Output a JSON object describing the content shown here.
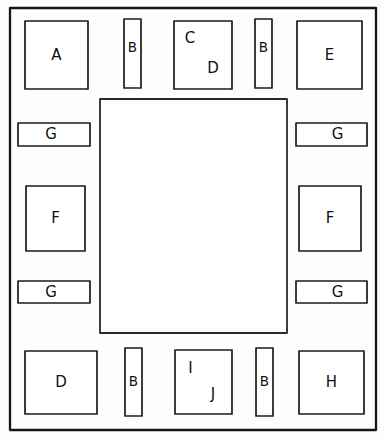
{
  "figure": {
    "style": "hand-drawn line diagram",
    "stroke_color": "#1b1b1b",
    "fill_color": "#ffffff",
    "page_color": "#f2f2f0"
  },
  "outer_frame": {
    "name": "outer-boundary",
    "x": 10,
    "y": 8,
    "width": 366,
    "height": 422
  },
  "center_region": {
    "name": "central-area",
    "label": "",
    "x": 100,
    "y": 99,
    "width": 187,
    "height": 234
  },
  "components": [
    {
      "id": "top-left-square",
      "label": "A",
      "x": 25,
      "y": 21,
      "width": 63,
      "height": 68,
      "label_dx": 0,
      "label_dy": 0
    },
    {
      "id": "top-strip-left",
      "label": "B",
      "x": 124,
      "y": 19,
      "width": 17,
      "height": 69,
      "label_dx": 0,
      "label_dy": -6
    },
    {
      "id": "top-center-square",
      "label": "C",
      "x": 174,
      "y": 21,
      "width": 58,
      "height": 68,
      "label_dx": -13,
      "label_dy": -17
    },
    {
      "id": "top-strip-right",
      "label": "B",
      "x": 255,
      "y": 19,
      "width": 17,
      "height": 69,
      "label_dx": 0,
      "label_dy": -6
    },
    {
      "id": "top-right-square",
      "label": "E",
      "x": 297,
      "y": 21,
      "width": 65,
      "height": 68,
      "label_dx": 0,
      "label_dy": 0
    },
    {
      "id": "left-strip-upper",
      "label": "G",
      "x": 18,
      "y": 123,
      "width": 72,
      "height": 23,
      "label_dx": -3,
      "label_dy": 0
    },
    {
      "id": "right-strip-upper",
      "label": "G",
      "x": 296,
      "y": 123,
      "width": 71,
      "height": 23,
      "label_dx": 6,
      "label_dy": 0
    },
    {
      "id": "left-square-middle",
      "label": "F",
      "x": 26,
      "y": 186,
      "width": 59,
      "height": 65,
      "label_dx": 0,
      "label_dy": 0
    },
    {
      "id": "right-square-middle",
      "label": "F",
      "x": 299,
      "y": 186,
      "width": 62,
      "height": 65,
      "label_dx": 0,
      "label_dy": 0
    },
    {
      "id": "left-strip-lower",
      "label": "G",
      "x": 18,
      "y": 281,
      "width": 72,
      "height": 22,
      "label_dx": -3,
      "label_dy": 0
    },
    {
      "id": "right-strip-lower",
      "label": "G",
      "x": 296,
      "y": 281,
      "width": 71,
      "height": 22,
      "label_dx": 6,
      "label_dy": 0
    },
    {
      "id": "bottom-left-square",
      "label": "D",
      "x": 25,
      "y": 351,
      "width": 72,
      "height": 63,
      "label_dx": 0,
      "label_dy": 0
    },
    {
      "id": "bottom-strip-left",
      "label": "B",
      "x": 125,
      "y": 348,
      "width": 17,
      "height": 68,
      "label_dx": 0,
      "label_dy": 0
    },
    {
      "id": "bottom-center-square",
      "label": "I",
      "x": 175,
      "y": 350,
      "width": 57,
      "height": 64,
      "label_dx": -13,
      "label_dy": -14
    },
    {
      "id": "bottom-strip-right",
      "label": "B",
      "x": 256,
      "y": 348,
      "width": 17,
      "height": 68,
      "label_dx": 0,
      "label_dy": 0
    },
    {
      "id": "bottom-right-square",
      "label": "H",
      "x": 299,
      "y": 351,
      "width": 65,
      "height": 63,
      "label_dx": 0,
      "label_dy": 0
    }
  ],
  "secondary_labels": [
    {
      "id": "top-center-second",
      "label": "D",
      "x": 213,
      "y": 68
    },
    {
      "id": "bottom-center-second",
      "label": "J",
      "x": 213,
      "y": 394
    }
  ]
}
